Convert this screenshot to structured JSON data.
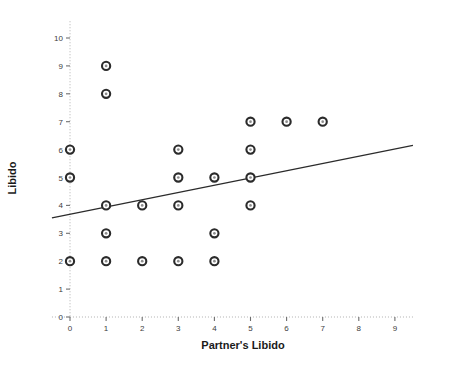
{
  "chart_data": {
    "type": "scatter",
    "title": "",
    "xlabel": "Partner's Libido",
    "ylabel": "Libido",
    "xlim": [
      -0.5,
      9.5
    ],
    "ylim": [
      0,
      10.6
    ],
    "xticks": [
      0,
      1,
      2,
      3,
      4,
      5,
      6,
      7,
      8,
      9
    ],
    "xtick_labels": [
      "0",
      "1",
      "2",
      "3",
      "4",
      "5",
      "6",
      "7",
      "8",
      "9"
    ],
    "yticks": [
      0,
      1,
      2,
      3,
      4,
      5,
      6,
      7,
      8,
      9,
      10
    ],
    "ytick_labels": [
      "0",
      "1",
      "2",
      "3",
      "4",
      "5",
      "6",
      "7",
      "8",
      "9",
      "10"
    ],
    "grid": false,
    "legend": null,
    "marker_style": "open-circle-dark-ring",
    "points": [
      {
        "x": 0,
        "y": 6
      },
      {
        "x": 0,
        "y": 5
      },
      {
        "x": 0,
        "y": 2
      },
      {
        "x": 1,
        "y": 9
      },
      {
        "x": 1,
        "y": 8
      },
      {
        "x": 1,
        "y": 4
      },
      {
        "x": 1,
        "y": 3
      },
      {
        "x": 1,
        "y": 2
      },
      {
        "x": 2,
        "y": 4
      },
      {
        "x": 2,
        "y": 2
      },
      {
        "x": 3,
        "y": 6
      },
      {
        "x": 3,
        "y": 5
      },
      {
        "x": 3,
        "y": 4
      },
      {
        "x": 3,
        "y": 2
      },
      {
        "x": 4,
        "y": 5
      },
      {
        "x": 4,
        "y": 3
      },
      {
        "x": 4,
        "y": 2
      },
      {
        "x": 5,
        "y": 7
      },
      {
        "x": 5,
        "y": 6
      },
      {
        "x": 5,
        "y": 5
      },
      {
        "x": 5,
        "y": 4
      },
      {
        "x": 6,
        "y": 7
      },
      {
        "x": 7,
        "y": 7
      }
    ],
    "fit_line": {
      "name": "linear-fit",
      "x_start": -0.5,
      "y_start": 3.55,
      "x_end": 9.5,
      "y_end": 6.15
    },
    "colors": {
      "marker_ring": "#2b2b2b",
      "marker_center": "#8c8c8c",
      "fit_line": "#2b2b2b",
      "axis": "#b0b0b0",
      "tick_mark": "#6e6e6e",
      "text": "#1a1a1a",
      "background": "#ffffff"
    }
  }
}
